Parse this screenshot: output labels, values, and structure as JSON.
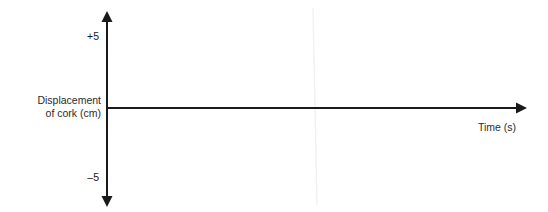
{
  "chart_data": {
    "type": "line",
    "title": "",
    "subtitle": "",
    "xlabel": "Time (s)",
    "ylabel": "Displacement of cork (cm)",
    "ylabel_line1": "Displacement",
    "ylabel_line2": "of cork (cm)",
    "xlim": [
      0,
      5.45
    ],
    "ylim": [
      -5.6,
      5.6
    ],
    "x_ticks": [
      1,
      2,
      3,
      4,
      5
    ],
    "x_tick_labels": [
      "1",
      "2",
      "3",
      "4",
      "5"
    ],
    "y_ticks": [
      5,
      -5
    ],
    "y_tick_labels": [
      "+5",
      "–5"
    ],
    "grid": false,
    "legend": null,
    "series": [
      {
        "name": "cork displacement",
        "waveform": "sine",
        "amplitude": 4.2,
        "period": 2.0,
        "phase": 0,
        "color": "#d9d9d9",
        "x": [
          0.0,
          0.1,
          0.2,
          0.3,
          0.4,
          0.5,
          0.6,
          0.7,
          0.8,
          0.9,
          1.0,
          1.1,
          1.2,
          1.3,
          1.4,
          1.5,
          1.6,
          1.7,
          1.8,
          1.9,
          2.0,
          2.1,
          2.2,
          2.3,
          2.4,
          2.5,
          2.6,
          2.7,
          2.8,
          2.9,
          3.0,
          3.1,
          3.2,
          3.3,
          3.4,
          3.5,
          3.6,
          3.7,
          3.8,
          3.9,
          4.0,
          4.1,
          4.2,
          4.3,
          4.4,
          4.5,
          4.6,
          4.7,
          4.8,
          4.9,
          5.0
        ],
        "values": [
          0.0,
          1.3,
          2.47,
          3.4,
          3.99,
          4.2,
          3.99,
          3.4,
          2.47,
          1.3,
          0.0,
          -1.3,
          -2.47,
          -3.4,
          -3.99,
          -4.2,
          -3.99,
          -3.4,
          -2.47,
          -1.3,
          0.0,
          1.3,
          2.47,
          3.4,
          3.99,
          4.2,
          3.99,
          3.4,
          2.47,
          1.3,
          0.0,
          -1.3,
          -2.47,
          -3.4,
          -3.99,
          -4.2,
          -3.99,
          -3.4,
          -2.47,
          -1.3,
          0.0,
          1.3,
          2.47,
          3.4,
          3.99,
          4.2,
          3.99,
          3.4,
          2.47,
          1.3,
          0.0
        ]
      }
    ],
    "annotations": [],
    "axis_style": {
      "x_axis_arrow": "right",
      "y_axis_arrow": "both",
      "axis_color": "#1a1a1a",
      "curve_color": "#d9d9d9"
    }
  },
  "colors": {
    "background": "#ffffff",
    "axis": "#1a1a1a",
    "curve": "#d9d9d9",
    "text": "#2b2b2b"
  }
}
